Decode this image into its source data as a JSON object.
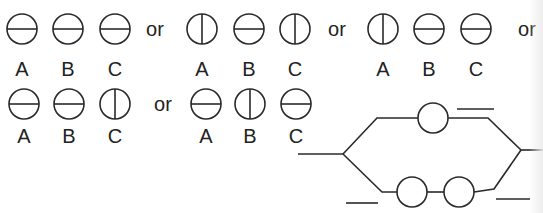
{
  "colors": {
    "stroke": "#2a2a2a",
    "text": "#222222",
    "background": "#ffffff"
  },
  "separator": "or",
  "row1": {
    "groups": [
      {
        "labels": [
          "A",
          "B",
          "C"
        ],
        "orientations": [
          "horizontal",
          "horizontal",
          "horizontal"
        ]
      },
      {
        "labels": [
          "A",
          "B",
          "C"
        ],
        "orientations": [
          "vertical",
          "horizontal",
          "vertical"
        ]
      },
      {
        "labels": [
          "A",
          "B",
          "C"
        ],
        "orientations": [
          "vertical",
          "horizontal",
          "horizontal"
        ]
      }
    ]
  },
  "row2": {
    "groups": [
      {
        "labels": [
          "A",
          "B",
          "C"
        ],
        "orientations": [
          "horizontal",
          "horizontal",
          "vertical"
        ]
      },
      {
        "labels": [
          "A",
          "B",
          "C"
        ],
        "orientations": [
          "horizontal",
          "vertical",
          "horizontal"
        ]
      }
    ]
  },
  "network": {
    "description": "parallel circuit: one element on upper branch, two elements in series on lower branch",
    "upper_branch_elements": 1,
    "lower_branch_elements": 2,
    "blank_lines": 3
  }
}
